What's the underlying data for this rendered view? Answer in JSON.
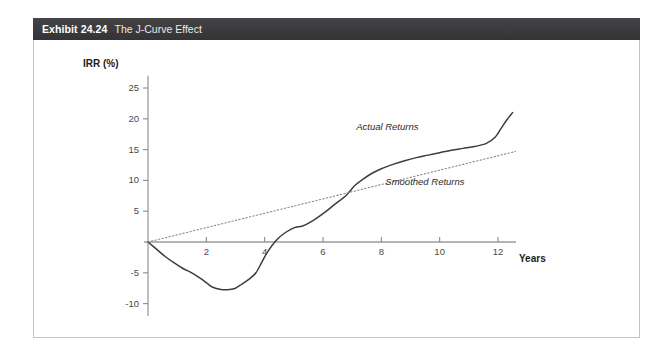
{
  "header": {
    "exhibit_number": "Exhibit 24.24",
    "title": "The J-Curve Effect"
  },
  "chart_data": {
    "type": "line",
    "title": "The J-Curve Effect",
    "xlabel": "Years",
    "ylabel": "IRR (%)",
    "xlim": [
      0,
      12.8
    ],
    "ylim": [
      -12,
      27
    ],
    "grid": false,
    "legend_position": "inline-annotation",
    "xticks": [
      2,
      4,
      6,
      8,
      10,
      12
    ],
    "yticks": [
      25,
      20,
      15,
      10,
      5,
      -5,
      -10
    ],
    "xtick_labels": [
      "2",
      "4",
      "6",
      "8",
      "10",
      "12"
    ],
    "ytick_labels": [
      "25",
      "20",
      "15",
      "10",
      "5",
      "-5",
      "-10"
    ],
    "series": [
      {
        "name": "Actual Returns",
        "style": "solid",
        "color": "#3d3d3d",
        "x": [
          0.0,
          0.3,
          0.6,
          0.9,
          1.2,
          1.5,
          1.8,
          2.0,
          2.2,
          2.5,
          2.8,
          3.0,
          3.2,
          3.5,
          3.7,
          3.9,
          4.1,
          4.4,
          4.7,
          5.0,
          5.3,
          5.6,
          6.0,
          6.4,
          6.8,
          7.1,
          7.4,
          7.7,
          8.0,
          8.4,
          8.8,
          9.2,
          9.6,
          10.0,
          10.4,
          10.8,
          11.2,
          11.6,
          11.9,
          12.1,
          12.3,
          12.5
        ],
        "y": [
          0.0,
          -1.2,
          -2.4,
          -3.4,
          -4.3,
          -5.0,
          -5.9,
          -6.6,
          -7.3,
          -7.7,
          -7.7,
          -7.5,
          -6.9,
          -5.9,
          -5.0,
          -3.3,
          -1.6,
          0.3,
          1.5,
          2.3,
          2.6,
          3.3,
          4.6,
          6.1,
          7.6,
          9.2,
          10.3,
          11.2,
          11.9,
          12.6,
          13.2,
          13.7,
          14.1,
          14.5,
          14.9,
          15.2,
          15.5,
          16.0,
          17.0,
          18.4,
          19.8,
          21.0
        ]
      },
      {
        "name": "Smoothed Returns",
        "style": "dotted",
        "color": "#8a8a8a",
        "x": [
          0,
          12.6
        ],
        "y": [
          0,
          14.7
        ]
      }
    ],
    "annotations": [
      {
        "text": "Actual Returns",
        "x": 9.4,
        "y": 18.5
      },
      {
        "text": "Smoothed Returns",
        "x": 10.4,
        "y": 9.5
      }
    ],
    "axis_origin": {
      "x": 0,
      "y": 0
    }
  }
}
